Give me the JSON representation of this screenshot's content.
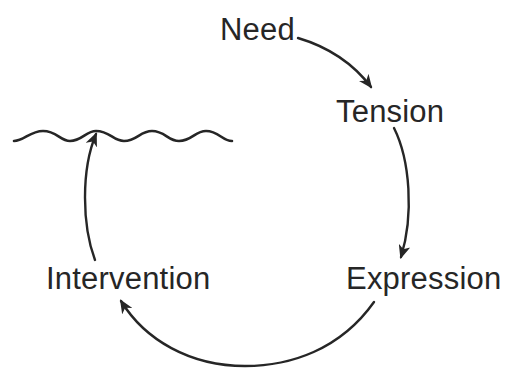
{
  "diagram": {
    "type": "cycle",
    "background": "#ffffff",
    "ink_color": "#262626",
    "nodes": [
      {
        "id": "need",
        "label": "Need"
      },
      {
        "id": "tension",
        "label": "Tension"
      },
      {
        "id": "expression",
        "label": "Expression"
      },
      {
        "id": "intervention",
        "label": "Intervention"
      }
    ],
    "edges": [
      {
        "from": "need",
        "to": "tension"
      },
      {
        "from": "tension",
        "to": "expression"
      },
      {
        "from": "expression",
        "to": "intervention"
      },
      {
        "from": "intervention",
        "to": "wave-line"
      }
    ],
    "decorations": [
      {
        "id": "wave-line",
        "shape": "wavy-line"
      }
    ]
  }
}
